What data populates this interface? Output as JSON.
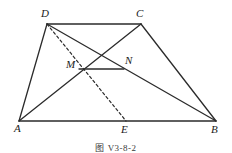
{
  "figure": {
    "caption": "图 V3-8-2",
    "type": "geometry-diagram",
    "stroke_color": "#2b2b2b",
    "background_color": "#ffffff"
  },
  "points": {
    "A": {
      "label": "A",
      "x": 19,
      "y": 121,
      "label_x": 15,
      "label_y": 124
    },
    "B": {
      "label": "B",
      "x": 216,
      "y": 121,
      "label_x": 211,
      "label_y": 125
    },
    "C": {
      "label": "C",
      "x": 141,
      "y": 24,
      "label_x": 137,
      "label_y": 9
    },
    "D": {
      "label": "D",
      "x": 47,
      "y": 24,
      "label_x": 41,
      "label_y": 9
    },
    "E": {
      "label": "E",
      "x": 126,
      "y": 121,
      "label_x": 121,
      "label_y": 125
    },
    "M": {
      "label": "M",
      "x": 79,
      "y": 69,
      "label_x": 67,
      "label_y": 60
    },
    "N": {
      "label": "N",
      "x": 124,
      "y": 69,
      "label_x": 125,
      "label_y": 56
    }
  },
  "segments": [
    {
      "name": "side-DC",
      "from": "D",
      "to": "C",
      "style": "solid"
    },
    {
      "name": "side-AB",
      "from": "A",
      "to": "B",
      "style": "solid"
    },
    {
      "name": "side-AD",
      "from": "A",
      "to": "D",
      "style": "solid"
    },
    {
      "name": "side-CB",
      "from": "C",
      "to": "B",
      "style": "solid"
    },
    {
      "name": "diagonal-AC",
      "from": "A",
      "to": "C",
      "style": "solid"
    },
    {
      "name": "diagonal-DB",
      "from": "D",
      "to": "B",
      "style": "solid"
    },
    {
      "name": "cevian-DE",
      "from": "D",
      "to": "E",
      "style": "dashed"
    },
    {
      "name": "midsegment-MN",
      "from": "M",
      "to": "N",
      "style": "solid"
    }
  ]
}
